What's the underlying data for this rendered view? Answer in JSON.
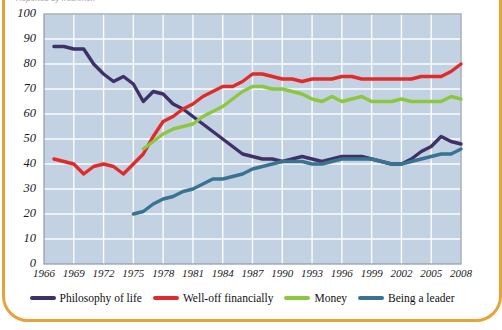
{
  "figure": {
    "supertitle": "Reported by freshmen",
    "frame_color": "#E5A33A",
    "plot_bg": "#C3D2E2",
    "grid_color": "#FFFFFF"
  },
  "legend": {
    "position": "bottom",
    "items": [
      {
        "label": "Philosophy of life",
        "color": "#3E3168",
        "key": "philosophy"
      },
      {
        "label": "Well-off financially",
        "color": "#E02B2B",
        "key": "welloff"
      },
      {
        "label": "Money",
        "color": "#8DC63F",
        "key": "money"
      },
      {
        "label": "Being a leader",
        "color": "#3A7391",
        "key": "leader"
      }
    ]
  },
  "chart_data": {
    "type": "line",
    "title": "",
    "xlabel": "",
    "ylabel": "",
    "xlim": [
      1966,
      2008
    ],
    "ylim": [
      0,
      100
    ],
    "ytick_step": 10,
    "grid": true,
    "legend_position": "bottom",
    "yticks": [
      0,
      10,
      20,
      30,
      40,
      50,
      60,
      70,
      80,
      90,
      100
    ],
    "xticks": [
      1966,
      1969,
      1972,
      1975,
      1978,
      1981,
      1984,
      1987,
      1990,
      1993,
      1996,
      1999,
      2002,
      2005,
      2008
    ],
    "series": [
      {
        "name": "Philosophy of life",
        "color": "#3E3168",
        "x": [
          1967,
          1968,
          1969,
          1970,
          1971,
          1972,
          1973,
          1974,
          1975,
          1976,
          1977,
          1978,
          1979,
          1980,
          1981,
          1982,
          1983,
          1984,
          1985,
          1986,
          1987,
          1988,
          1989,
          1990,
          1991,
          1992,
          1993,
          1994,
          1995,
          1996,
          1997,
          1998,
          1999,
          2000,
          2001,
          2002,
          2003,
          2004,
          2005,
          2006,
          2007,
          2008
        ],
        "values": [
          87,
          87,
          86,
          86,
          80,
          76,
          73,
          75,
          72,
          65,
          69,
          68,
          64,
          62,
          59,
          56,
          53,
          50,
          47,
          44,
          43,
          42,
          42,
          41,
          42,
          43,
          42,
          41,
          42,
          43,
          43,
          43,
          42,
          41,
          40,
          40,
          42,
          45,
          47,
          51,
          49,
          48
        ]
      },
      {
        "name": "Well-off financially",
        "color": "#E02B2B",
        "x": [
          1967,
          1968,
          1969,
          1970,
          1971,
          1972,
          1973,
          1974,
          1975,
          1976,
          1977,
          1978,
          1979,
          1980,
          1981,
          1982,
          1983,
          1984,
          1985,
          1986,
          1987,
          1988,
          1989,
          1990,
          1991,
          1992,
          1993,
          1994,
          1995,
          1996,
          1997,
          1998,
          1999,
          2000,
          2001,
          2002,
          2003,
          2004,
          2005,
          2006,
          2007,
          2008
        ],
        "values": [
          42,
          41,
          40,
          36,
          39,
          40,
          39,
          36,
          40,
          44,
          51,
          57,
          59,
          62,
          64,
          67,
          69,
          71,
          71,
          73,
          76,
          76,
          75,
          74,
          74,
          73,
          74,
          74,
          74,
          75,
          75,
          74,
          74,
          74,
          74,
          74,
          74,
          75,
          75,
          75,
          77,
          80
        ]
      },
      {
        "name": "Money",
        "color": "#8DC63F",
        "x": [
          1976,
          1977,
          1978,
          1979,
          1980,
          1981,
          1982,
          1983,
          1984,
          1985,
          1986,
          1987,
          1988,
          1989,
          1990,
          1991,
          1992,
          1993,
          1994,
          1995,
          1996,
          1997,
          1998,
          1999,
          2000,
          2001,
          2002,
          2003,
          2004,
          2005,
          2006,
          2007,
          2008
        ],
        "values": [
          46,
          49,
          52,
          54,
          55,
          56,
          59,
          61,
          63,
          66,
          69,
          71,
          71,
          70,
          70,
          69,
          68,
          66,
          65,
          67,
          65,
          66,
          67,
          65,
          65,
          65,
          66,
          65,
          65,
          65,
          65,
          67,
          66
        ]
      },
      {
        "name": "Being a leader",
        "color": "#3A7391",
        "x": [
          1975,
          1976,
          1977,
          1978,
          1979,
          1980,
          1981,
          1982,
          1983,
          1984,
          1985,
          1986,
          1987,
          1988,
          1989,
          1990,
          1991,
          1992,
          1993,
          1994,
          1995,
          1996,
          1997,
          1998,
          1999,
          2000,
          2001,
          2002,
          2003,
          2004,
          2005,
          2006,
          2007,
          2008
        ],
        "values": [
          20,
          21,
          24,
          26,
          27,
          29,
          30,
          32,
          34,
          34,
          35,
          36,
          38,
          39,
          40,
          41,
          41,
          41,
          40,
          40,
          41,
          42,
          42,
          42,
          42,
          41,
          40,
          40,
          41,
          42,
          43,
          44,
          44,
          46
        ]
      }
    ]
  }
}
